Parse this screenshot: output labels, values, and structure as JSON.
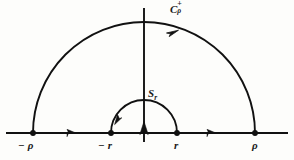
{
  "figure": {
    "name": "complex-contour-indented-semicircle",
    "background_color": "#fdfdfb",
    "stroke_color": "#111111"
  },
  "labels": {
    "large_arc": {
      "base": "C",
      "superscript": "+",
      "subscript": "ρ",
      "full": "Cρ+"
    },
    "small_arc": {
      "base": "S",
      "subscript": "r",
      "full": "Sr"
    },
    "axis_points": [
      {
        "id": "neg-rho",
        "text": "− ρ"
      },
      {
        "id": "neg-r",
        "text": "− r"
      },
      {
        "id": "pos-r",
        "text": "r"
      },
      {
        "id": "pos-rho",
        "text": "ρ"
      }
    ]
  },
  "geometry": {
    "origin": {
      "x": 144,
      "y": 133
    },
    "real_axis": {
      "x1": 6,
      "x2": 288,
      "y": 133
    },
    "imaginary_axis": {
      "x": 144,
      "y1": 8,
      "y2": 142
    },
    "large_semicircle": {
      "cx": 144,
      "cy": 133,
      "radius": 111
    },
    "small_semicircle": {
      "cx": 144,
      "cy": 133,
      "radius": 33
    },
    "nodes": [
      {
        "id": "neg-rho",
        "x": 33,
        "y": 133
      },
      {
        "id": "neg-r",
        "x": 111,
        "y": 133
      },
      {
        "id": "pos-r",
        "x": 177,
        "y": 133
      },
      {
        "id": "pos-rho",
        "x": 255,
        "y": 133
      }
    ],
    "direction_arrows": [
      {
        "id": "left-segment-arrow",
        "direction": "right"
      },
      {
        "id": "right-segment-arrow",
        "direction": "right"
      },
      {
        "id": "small-arc-arrow",
        "direction": "clockwise-over-origin"
      },
      {
        "id": "large-arc-arrow",
        "direction": "counterclockwise"
      },
      {
        "id": "origin-arrow",
        "direction": "up"
      }
    ]
  }
}
